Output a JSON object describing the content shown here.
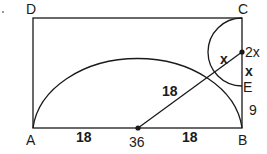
{
  "diagram": {
    "type": "geometry",
    "points": {
      "A": "A",
      "B": "B",
      "C": "C",
      "D": "D",
      "E": "E"
    },
    "segment_labels": {
      "AO": "18",
      "OB": "18",
      "radius_to_tangent": "18",
      "BE": "9",
      "small_segment_1": "x",
      "small_segment_2": "x",
      "center_marker": "36",
      "point_label": "2x"
    },
    "colors": {
      "stroke": "#1a1a1a",
      "background": "#ffffff"
    }
  }
}
